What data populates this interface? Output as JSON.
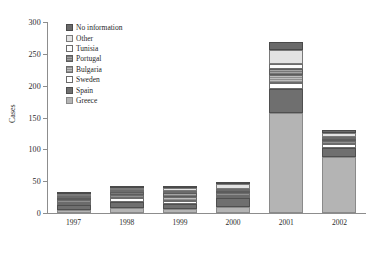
{
  "chart_data": {
    "type": "bar",
    "stacked": true,
    "title": "",
    "xlabel": "",
    "ylabel": "Cases",
    "categories": [
      "1997",
      "1998",
      "1999",
      "2000",
      "2001",
      "2002"
    ],
    "ylim": [
      0,
      300
    ],
    "ytick_step": 50,
    "yticks": [
      0,
      50,
      100,
      150,
      200,
      250,
      300
    ],
    "grid": false,
    "legend_position": "upper-left-inside",
    "series": [
      {
        "name": "Greece",
        "color": "#b4b4b4",
        "values": [
          5,
          8,
          6,
          10,
          157,
          88
        ]
      },
      {
        "name": "Spain",
        "color": "#6f6f6f",
        "values": [
          8,
          9,
          8,
          14,
          38,
          14
        ]
      },
      {
        "name": "Sweden",
        "color": "#ffffff",
        "values": [
          3,
          6,
          5,
          3,
          9,
          6
        ]
      },
      {
        "name": "Bulgaria",
        "color": "#a8a8a8",
        "values": [
          4,
          5,
          6,
          4,
          13,
          5
        ]
      },
      {
        "name": "Portugal",
        "color": "#909090",
        "values": [
          3,
          5,
          6,
          4,
          10,
          4
        ]
      },
      {
        "name": "Tunisia",
        "color": "#fbfbfb",
        "values": [
          1,
          3,
          4,
          3,
          7,
          3
        ]
      },
      {
        "name": "Other",
        "color": "#e3e3e3",
        "values": [
          2,
          4,
          4,
          7,
          22,
          6
        ]
      },
      {
        "name": "No information",
        "color": "#6a6a6a",
        "values": [
          1,
          2,
          2,
          3,
          12,
          4
        ]
      }
    ],
    "totals": [
      27,
      42,
      41,
      48,
      268,
      130
    ],
    "legend_order": [
      "No information",
      "Other",
      "Tunisia",
      "Portugal",
      "Bulgaria",
      "Sweden",
      "Spain",
      "Greece"
    ]
  }
}
